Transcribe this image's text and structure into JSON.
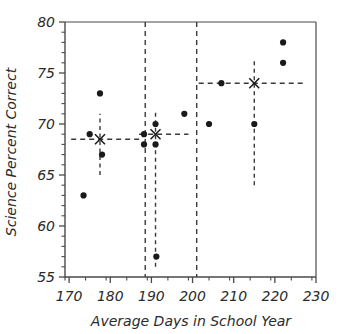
{
  "chart_data": {
    "type": "scatter",
    "title": "",
    "xlabel": "Average Days in School Year",
    "ylabel": "Science Percent Correct",
    "xlim": [
      169,
      230
    ],
    "ylim": [
      55,
      80
    ],
    "xticks": [
      170,
      180,
      190,
      200,
      210,
      220,
      230
    ],
    "xticklabels": [
      "170",
      "180",
      "190",
      "200",
      "210",
      "220",
      "230"
    ],
    "xminor_step": 5,
    "yticks": [
      55,
      60,
      65,
      70,
      75,
      80
    ],
    "yticklabels": [
      "55",
      "60",
      "65",
      "70",
      "75",
      "80"
    ],
    "yminor_step": 1,
    "grid": false,
    "legend": "none",
    "points": [
      {
        "x": 173.5,
        "y": 63
      },
      {
        "x": 175.0,
        "y": 69
      },
      {
        "x": 177.5,
        "y": 73
      },
      {
        "x": 178.0,
        "y": 67
      },
      {
        "x": 188.2,
        "y": 69
      },
      {
        "x": 188.2,
        "y": 68
      },
      {
        "x": 191.0,
        "y": 70
      },
      {
        "x": 191.0,
        "y": 68
      },
      {
        "x": 191.2,
        "y": 57
      },
      {
        "x": 198.0,
        "y": 71
      },
      {
        "x": 204.0,
        "y": 70
      },
      {
        "x": 207.0,
        "y": 74
      },
      {
        "x": 215.0,
        "y": 70
      },
      {
        "x": 222.0,
        "y": 78
      },
      {
        "x": 222.0,
        "y": 76
      }
    ],
    "group_means": [
      {
        "label": "group-1",
        "x": 177.5,
        "y": 68.5,
        "err_low": 65.0,
        "err_high": 71.0,
        "line_x0": 170.5,
        "line_x1": 187.5
      },
      {
        "label": "group-2",
        "x": 191.0,
        "y": 69.0,
        "err_low": 56.0,
        "err_high": 71.2,
        "line_x0": 187.0,
        "line_x1": 199.0
      },
      {
        "label": "group-3",
        "x": 215.0,
        "y": 74.0,
        "err_low": 64.0,
        "err_high": 76.5,
        "line_x0": 201.5,
        "line_x1": 227.5
      }
    ],
    "separators": [
      {
        "label": "separator-1",
        "x": 188.5
      },
      {
        "label": "separator-2",
        "x": 201.0
      }
    ],
    "marker_style": "filled-circle",
    "mean_marker_style": "x-cross",
    "series_color": "#1a1a1a",
    "axis_color": "#4a4a4a",
    "dash_color": "#3a3a3a"
  }
}
